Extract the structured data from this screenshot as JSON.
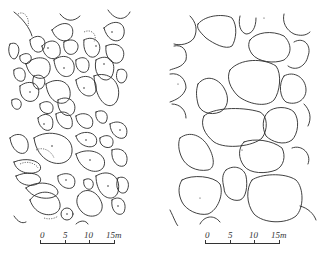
{
  "figure": {
    "panels": [
      {
        "id": "left",
        "description": "dense packing of many small-to-medium clast outlines with interior dots and some dashed outlines"
      },
      {
        "id": "right",
        "description": "sparser packing of larger clast outlines"
      }
    ],
    "scale_bars": [
      {
        "labels": [
          "0",
          "5",
          "10",
          "15m"
        ],
        "unit": "m",
        "max": 15
      },
      {
        "labels": [
          "0",
          "5",
          "10",
          "15m"
        ],
        "unit": "m",
        "max": 15
      }
    ],
    "colors": {
      "line": "#2a2a2a",
      "background": "#ffffff"
    }
  }
}
